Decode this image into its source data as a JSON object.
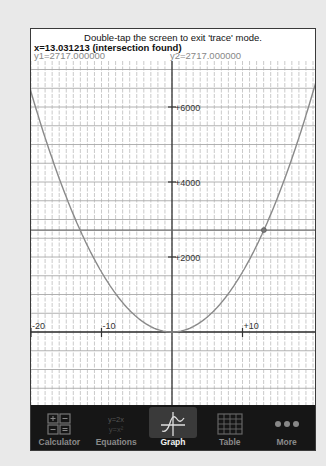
{
  "header": {
    "hint": "Double-tap the screen to exit 'trace' mode.",
    "trace_x": "x=13.031213 (intersection found)",
    "trace_y1": "y1=2717.000000",
    "trace_y2": "y2=2717.000000"
  },
  "graph": {
    "y_axis_labels": [
      "+6000",
      "+4000",
      "+2000"
    ],
    "x_axis_labels": [
      "-20",
      "-10",
      "+10"
    ],
    "curve_color": "#8a8a8a",
    "axis_color": "#333333",
    "grid_color": "#bdbdbd"
  },
  "chart_data": {
    "type": "line",
    "title": "",
    "xlabel": "",
    "ylabel": "",
    "xlim": [
      -20.3,
      20.3
    ],
    "ylim": [
      -1950,
      6900
    ],
    "grid": true,
    "series": [
      {
        "name": "y1",
        "expression": "approx 16x^2",
        "x": [
          -20,
          -15,
          -10,
          -5,
          0,
          5,
          10,
          13.031213,
          15,
          20
        ],
        "values": [
          6400,
          3600,
          1600,
          400,
          0,
          400,
          1600,
          2717,
          3600,
          6400
        ]
      },
      {
        "name": "y2",
        "expression": "constant",
        "x": [
          -20,
          20
        ],
        "values": [
          2717,
          2717
        ]
      }
    ],
    "trace_point": {
      "x": 13.031213,
      "y": 2717
    },
    "x_tick_labels": [
      "-20",
      "-10",
      "+10"
    ],
    "y_tick_labels": [
      "+2000",
      "+4000",
      "+6000"
    ]
  },
  "tabbar": {
    "tabs": [
      {
        "label": "Calculator",
        "icon": "calculator-icon",
        "active": false
      },
      {
        "label": "Equations",
        "icon": "equations-icon",
        "active": false,
        "icon_text": [
          "y=2x",
          "y=x²"
        ]
      },
      {
        "label": "Graph",
        "icon": "graph-icon",
        "active": true
      },
      {
        "label": "Table",
        "icon": "table-icon",
        "active": false
      },
      {
        "label": "More",
        "icon": "more-icon",
        "active": false
      }
    ]
  }
}
